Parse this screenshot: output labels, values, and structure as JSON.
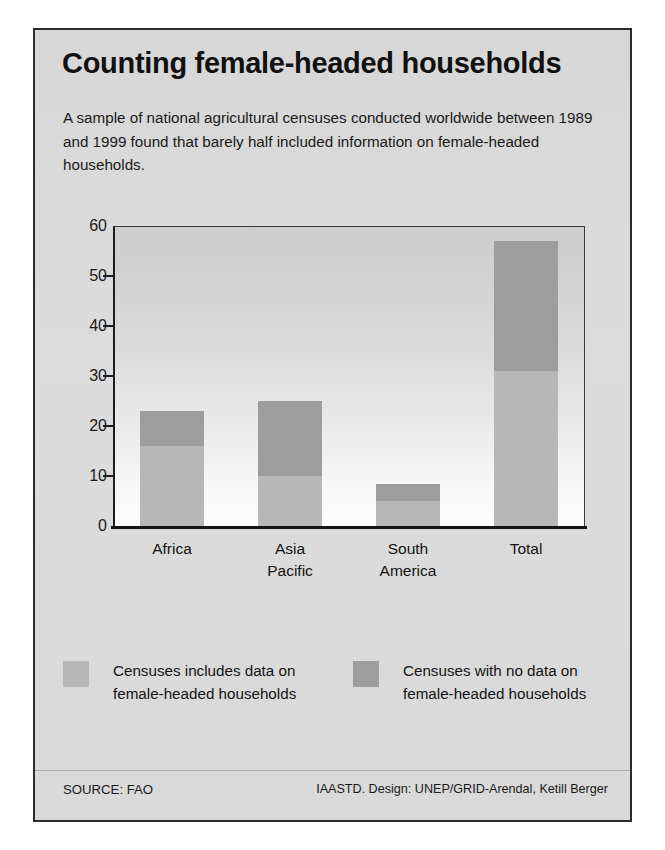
{
  "header": {
    "title": "Counting female-headed households",
    "subtitle": "A sample of national agricultural censuses conducted worldwide between 1989 and 1999 found that barely half included information on female-headed households."
  },
  "footer": {
    "source": "SOURCE: FAO",
    "credit": "IAASTD. Design: UNEP/GRID-Arendal, Ketill Berger"
  },
  "legend": {
    "items": [
      {
        "label": "Censuses includes data on female-headed households",
        "color": "#b7b7b7",
        "swatch_name": "legend-swatch-includes-data"
      },
      {
        "label": "Censuses with no data on female-headed households",
        "color": "#9d9d9d",
        "swatch_name": "legend-swatch-no-data"
      }
    ]
  },
  "chart_data": {
    "type": "bar",
    "title": "Counting female-headed households",
    "subtitle": "A sample of national agricultural censuses conducted worldwide between 1989 and 1999 found that barely half included information on female-headed households.",
    "stacked": true,
    "xlabel": "",
    "ylabel": "",
    "ylim": [
      0,
      60
    ],
    "yticks": [
      0,
      10,
      20,
      30,
      40,
      50,
      60
    ],
    "ytick_labels": [
      "0",
      "10",
      "20",
      "30",
      "40",
      "50",
      "60"
    ],
    "grid": false,
    "legend_position": "bottom",
    "categories": [
      "Africa",
      "Asia Pacific",
      "South America",
      "Total"
    ],
    "category_lines": [
      [
        "Africa"
      ],
      [
        "Asia",
        "Pacific"
      ],
      [
        "South",
        "America"
      ],
      [
        "Total"
      ]
    ],
    "series": [
      {
        "name": "Censuses includes data on female-headed households",
        "color": "#b7b7b7",
        "values": [
          16,
          10,
          5,
          31
        ]
      },
      {
        "name": "Censuses with no data on female-headed households",
        "color": "#9d9d9d",
        "values": [
          7,
          15,
          3.5,
          26
        ]
      }
    ],
    "totals": [
      23,
      25,
      8.5,
      57
    ]
  }
}
